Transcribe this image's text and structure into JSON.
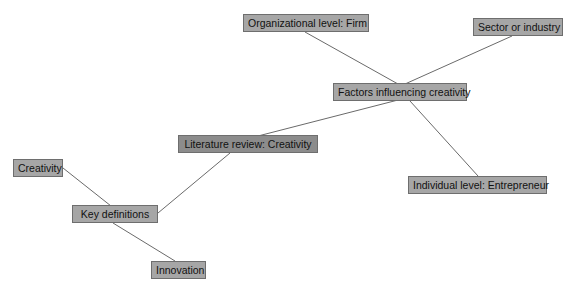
{
  "diagram": {
    "type": "mind-map",
    "nodes": [
      {
        "id": "lit",
        "label": "Literature review: Creativity",
        "x": 178,
        "y": 135,
        "w": 140,
        "root": true
      },
      {
        "id": "factors",
        "label": "Factors influencing creativity",
        "x": 333,
        "y": 83,
        "w": 134
      },
      {
        "id": "org",
        "label": "Organizational level: Firm",
        "x": 243,
        "y": 14,
        "w": 126
      },
      {
        "id": "sector",
        "label": "Sector or industry",
        "x": 473,
        "y": 18,
        "w": 90
      },
      {
        "id": "indiv",
        "label": "Individual level: Entrepreneur",
        "x": 408,
        "y": 176,
        "w": 139
      },
      {
        "id": "keydef",
        "label": "Key definitions",
        "x": 72,
        "y": 205,
        "w": 86
      },
      {
        "id": "creativity",
        "label": "Creativity",
        "x": 13,
        "y": 159,
        "w": 50
      },
      {
        "id": "innovation",
        "label": "Innovation",
        "x": 151,
        "y": 261,
        "w": 55
      }
    ],
    "edges": [
      {
        "from": "lit",
        "to": "factors",
        "x1": 258,
        "y1": 136,
        "x2": 398,
        "y2": 100
      },
      {
        "from": "lit",
        "to": "keydef",
        "x1": 230,
        "y1": 153,
        "x2": 158,
        "y2": 213
      },
      {
        "from": "factors",
        "to": "org",
        "x1": 398,
        "y1": 84,
        "x2": 305,
        "y2": 32
      },
      {
        "from": "factors",
        "to": "sector",
        "x1": 405,
        "y1": 84,
        "x2": 512,
        "y2": 36
      },
      {
        "from": "factors",
        "to": "indiv",
        "x1": 410,
        "y1": 101,
        "x2": 478,
        "y2": 176
      },
      {
        "from": "keydef",
        "to": "creativity",
        "x1": 111,
        "y1": 206,
        "x2": 63,
        "y2": 168
      },
      {
        "from": "keydef",
        "to": "innovation",
        "x1": 113,
        "y1": 223,
        "x2": 175,
        "y2": 261
      }
    ],
    "colors": {
      "node_fill": "#a6a6a6",
      "root_fill": "#8c8c8c",
      "node_border": "#6e6e6e",
      "edge": "#6a6a6a",
      "background": "#ffffff"
    }
  }
}
